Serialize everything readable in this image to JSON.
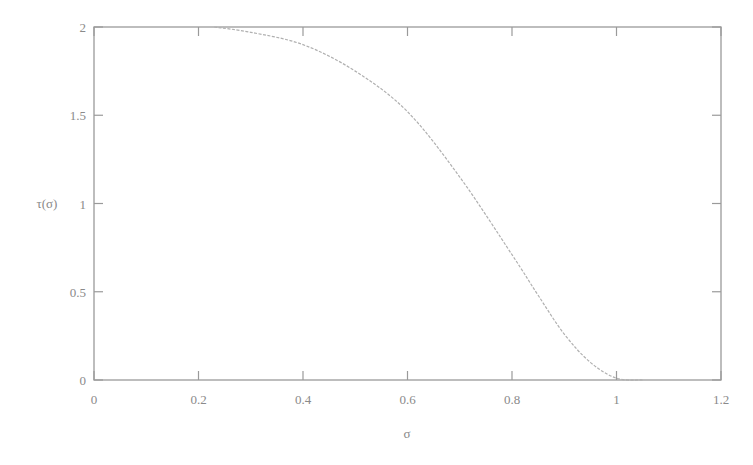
{
  "chart_data": {
    "type": "line",
    "title": "",
    "xlabel": "σ",
    "ylabel": "τ(σ)",
    "xlim": [
      0,
      1.2
    ],
    "ylim": [
      0,
      2
    ],
    "grid": false,
    "legend": null,
    "xticks": [
      "0",
      "0.2",
      "0.4",
      "0.6",
      "0.8",
      "1",
      "1.2"
    ],
    "yticks": [
      "0",
      "0.5",
      "1",
      "1.5",
      "2"
    ],
    "series": [
      {
        "name": "τ(σ)",
        "color": "#b0b0b0",
        "x": [
          0.23,
          0.3,
          0.4,
          0.5,
          0.6,
          0.7,
          0.8,
          0.85,
          0.9,
          0.95,
          1.0,
          1.05
        ],
        "y": [
          2.0,
          1.97,
          1.9,
          1.75,
          1.52,
          1.15,
          0.71,
          0.48,
          0.26,
          0.1,
          0.01,
          0.0
        ]
      }
    ]
  }
}
